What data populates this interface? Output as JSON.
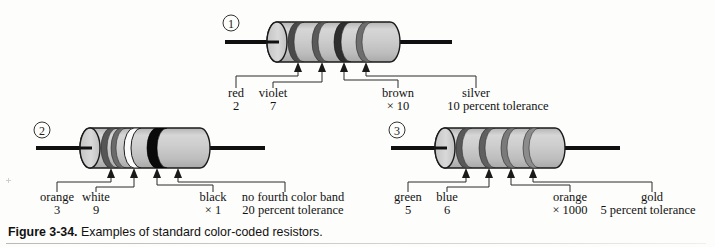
{
  "figure": {
    "caption_label": "Figure 3-34.",
    "caption_text": "Examples of standard color-coded resistors.",
    "background_color": "#fdfdfb",
    "ink_color": "#121212",
    "body_color": "#c8c8c8"
  },
  "resistors": [
    {
      "index_label": "1",
      "bands": [
        {
          "color_name": "red",
          "value_text": "2",
          "swatch": "#4a4a4a",
          "width": 6,
          "x": 298
        },
        {
          "color_name": "violet",
          "value_text": "7",
          "swatch": "#5a5a5a",
          "width": 6,
          "x": 322
        },
        {
          "color_name": "brown",
          "value_text": "× 10",
          "swatch": "#2e2e2e",
          "width": 7,
          "x": 344
        },
        {
          "color_name": "silver",
          "value_text": "10 percent tolerance",
          "swatch": "#6e6e6e",
          "width": 6,
          "x": 366
        }
      ]
    },
    {
      "index_label": "2",
      "bands": [
        {
          "color_name": "orange",
          "value_text": "3",
          "swatch": "#565656",
          "width": 6,
          "x": 111
        },
        {
          "color_name": "white",
          "value_text": "9",
          "swatch": "#fbfbfb",
          "width": 6,
          "x": 134
        },
        {
          "color_name": "black",
          "value_text": "× 1",
          "swatch": "#0a0a0a",
          "width": 10,
          "x": 157
        },
        {
          "color_name": "no fourth color band",
          "value_text": "20 percent tolerance",
          "swatch": null,
          "width": 0,
          "x": 178
        }
      ]
    },
    {
      "index_label": "3",
      "bands": [
        {
          "color_name": "green",
          "value_text": "5",
          "swatch": "#585858",
          "width": 6,
          "x": 466
        },
        {
          "color_name": "blue",
          "value_text": "6",
          "swatch": "#606060",
          "width": 6,
          "x": 489
        },
        {
          "color_name": "orange",
          "value_text": "× 1000",
          "swatch": "#7a7a7a",
          "width": 6,
          "x": 511
        },
        {
          "color_name": "gold",
          "value_text": "5 percent tolerance",
          "swatch": "#8c8c8c",
          "width": 6,
          "x": 533
        }
      ]
    }
  ],
  "labels": {
    "r1": {
      "a_name": "red",
      "a_val": "2",
      "b_name": "violet",
      "b_val": "7",
      "c_name": "brown",
      "c_val": "× 10",
      "d_name": "silver",
      "d_val": "10 percent tolerance"
    },
    "r2": {
      "a_name": "orange",
      "a_val": "3",
      "b_name": "white",
      "b_val": "9",
      "c_name": "black",
      "c_val": "× 1",
      "d_name": "no fourth color band",
      "d_val": "20 percent tolerance"
    },
    "r3": {
      "a_name": "green",
      "a_val": "5",
      "b_name": "blue",
      "b_val": "6",
      "c_name": "orange",
      "c_val": "× 1000",
      "d_name": "gold",
      "d_val": "5 percent tolerance"
    }
  },
  "index_numbers": {
    "one": "1",
    "two": "2",
    "three": "3"
  }
}
